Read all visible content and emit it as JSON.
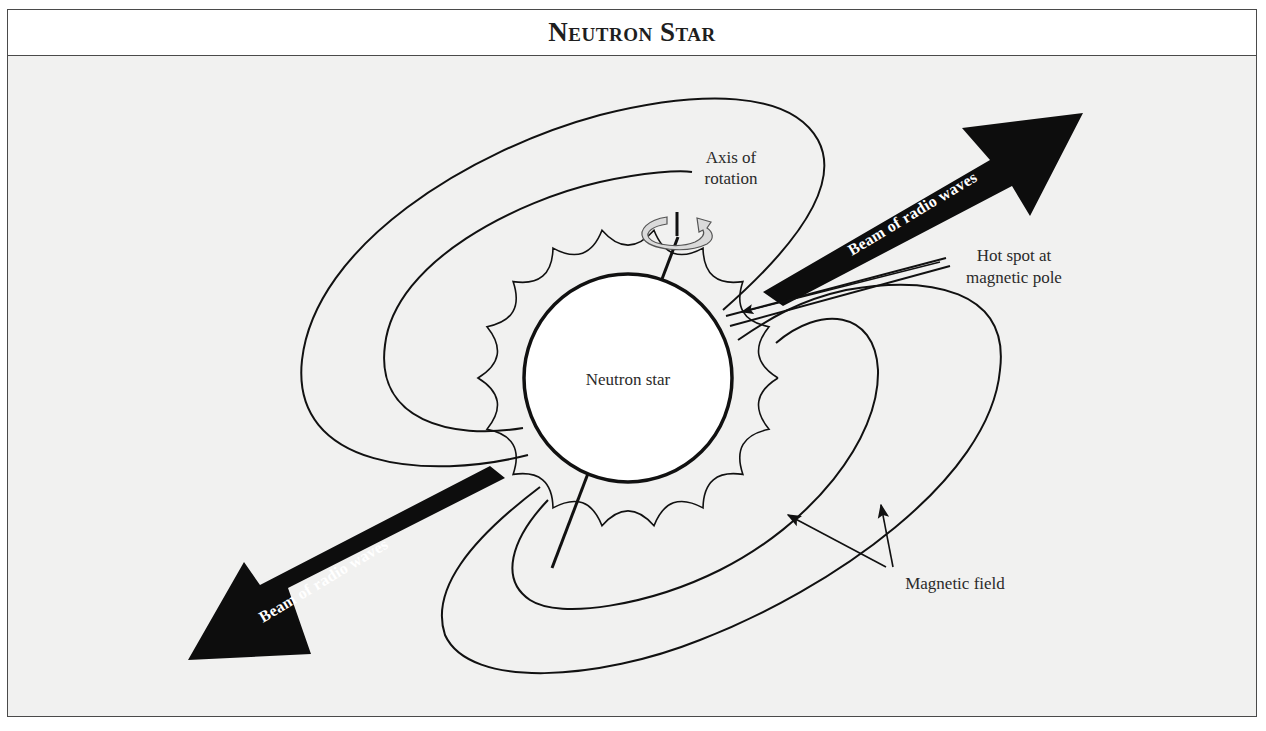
{
  "figure": {
    "title": "Neutron Star",
    "labels": {
      "star": "Neutron star",
      "axis_line1": "Axis of",
      "axis_line2": "rotation",
      "hotspot_line1": "Hot spot at",
      "hotspot_line2": "magnetic pole",
      "magnetic_field": "Magnetic field",
      "beam_upper": "Beam of radio waves",
      "beam_lower": "Beam of radio waves"
    },
    "icons": {
      "rotation": "rotation-arrow-icon"
    },
    "colors": {
      "background": "#f1f1f0",
      "ink": "#111111",
      "rotation_arrow": "#d9d9d9",
      "star_fill": "#ffffff"
    }
  }
}
